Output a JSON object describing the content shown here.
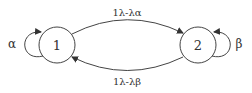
{
  "diagram": {
    "type": "state-transition",
    "colors": {
      "stroke": "#444444",
      "text": "#333333",
      "background": "#ffffff"
    },
    "nodes": [
      {
        "id": "1",
        "label": "1"
      },
      {
        "id": "2",
        "label": "2"
      }
    ],
    "edges": [
      {
        "from": "1",
        "to": "1",
        "label": "α"
      },
      {
        "from": "1",
        "to": "2",
        "label": "1λ-λα"
      },
      {
        "from": "2",
        "to": "1",
        "label": "1λ-λβ"
      },
      {
        "from": "2",
        "to": "2",
        "label": "β"
      }
    ]
  }
}
